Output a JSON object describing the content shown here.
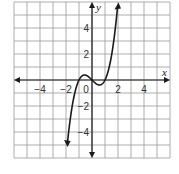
{
  "chart_data": {
    "type": "line",
    "title": "",
    "xlabel": "x",
    "ylabel": "y",
    "xlim": [
      -6,
      6
    ],
    "ylim": [
      -6,
      6
    ],
    "grid": true,
    "grid_step": 1,
    "x_ticks": [
      -4,
      -2,
      0,
      2,
      4
    ],
    "y_ticks": [
      4,
      2,
      -2,
      -4
    ],
    "x_tick_labels": [
      "−4",
      "−2",
      "0",
      "2",
      "4"
    ],
    "y_tick_labels": [
      "4",
      "2",
      "−2",
      "−4"
    ],
    "origin_label": "0",
    "function": "y = x^3 - x",
    "series": [
      {
        "name": "f(x)",
        "x": [
          -1.85,
          -1.5,
          -1.25,
          -1,
          -0.75,
          -0.577,
          -0.25,
          0,
          0.25,
          0.577,
          0.75,
          1,
          1.25,
          1.5,
          1.75,
          2
        ],
        "y": [
          -4.48,
          -1.88,
          -0.7,
          0,
          0.33,
          0.385,
          0.23,
          0,
          -0.23,
          -0.385,
          -0.33,
          0,
          0.7,
          1.88,
          3.61,
          6.0
        ]
      }
    ],
    "arrows": "both ends of curve and both axes have arrowheads",
    "colors": {
      "grid": "#9a9a9a",
      "axis": "#1a1a1a",
      "curve": "#1a1a1a"
    }
  }
}
